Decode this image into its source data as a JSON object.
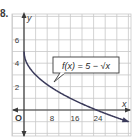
{
  "problem": {
    "number": "8."
  },
  "chart_data": {
    "type": "line",
    "title": "",
    "function_label": "f(x) = 5 − √x",
    "xlabel": "x",
    "ylabel": "y",
    "origin_label": "O",
    "x_ticks": [
      8,
      16,
      24
    ],
    "y_ticks": [
      2,
      4,
      6
    ],
    "xlim": [
      -4,
      36
    ],
    "ylim": [
      -2,
      8
    ],
    "grid": true,
    "x_grid_step": 4,
    "y_grid_step": 1,
    "series": [
      {
        "name": "f(x) = 5 − √x",
        "x": [
          0,
          1,
          2,
          4,
          6,
          9,
          12,
          16,
          20,
          25,
          30,
          35
        ],
        "y": [
          5,
          4,
          3.59,
          3,
          2.55,
          2,
          1.54,
          1,
          0.53,
          0,
          -0.48,
          -0.92
        ]
      }
    ],
    "colors": {
      "curve": "#3a3a5a",
      "grid": "#c8c8c8",
      "axis": "#3a3a3a",
      "label_box_border": "#3a3a3a"
    }
  }
}
